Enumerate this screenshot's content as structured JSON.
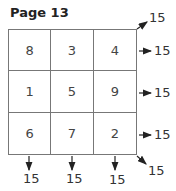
{
  "title": "Page 13",
  "grid": {
    "rows": [
      [
        "8",
        "3",
        "4"
      ],
      [
        "1",
        "5",
        "9"
      ],
      [
        "6",
        "7",
        "2"
      ]
    ]
  },
  "sums": {
    "row_sums": [
      "15",
      "15",
      "15"
    ],
    "col_sums": [
      "15",
      "15",
      "15"
    ],
    "diag_up": "15",
    "diag_down": "15"
  }
}
